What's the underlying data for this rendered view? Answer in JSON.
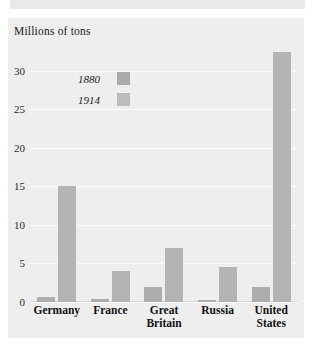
{
  "figure": {
    "panel_bg": "#eeeeee",
    "gridline_color": "#fbfbfb",
    "axis_title": "Millions of tons"
  },
  "legend": {
    "position": "inside-top-left",
    "entries": [
      {
        "label": "1880",
        "color": "#aaaaaa"
      },
      {
        "label": "1914",
        "color": "#bcbcbc"
      }
    ]
  },
  "yaxis": {
    "ticks": [
      "0",
      "5",
      "10",
      "15",
      "20",
      "25",
      "30"
    ],
    "min": 0,
    "max": 34
  },
  "xaxis": {
    "labels": [
      "Germany",
      "France",
      "Great\nBritain",
      "Russia",
      "United\nStates"
    ]
  },
  "chart_data": {
    "type": "bar",
    "title": "",
    "xlabel": "",
    "ylabel": "Millions of tons",
    "ylim": [
      0,
      34
    ],
    "yticks": [
      0,
      5,
      10,
      15,
      20,
      25,
      30
    ],
    "grid": true,
    "legend_position": "inside-top-left",
    "categories": [
      "Germany",
      "France",
      "Great Britain",
      "Russia",
      "United States"
    ],
    "series": [
      {
        "name": "1880",
        "color": "#adadad",
        "values": [
          0.7,
          0.4,
          2.0,
          0.3,
          2.0
        ]
      },
      {
        "name": "1914",
        "color": "#b4b4b4",
        "values": [
          15.0,
          4.0,
          7.0,
          4.5,
          32.5
        ]
      }
    ]
  }
}
